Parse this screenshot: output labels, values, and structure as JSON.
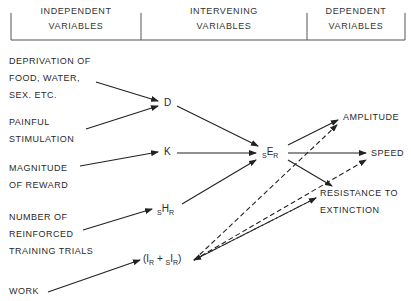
{
  "header": {
    "columns": [
      {
        "line1": "INDEPENDENT",
        "line2": "VARIABLES"
      },
      {
        "line1": "INTERVENING",
        "line2": "VARIABLES"
      },
      {
        "line1": "DEPENDENT",
        "line2": "VARIABLES"
      }
    ]
  },
  "independent": [
    {
      "lines": [
        "DEPRIVATION OF",
        "FOOD, WATER,",
        "SEX. ETC."
      ]
    },
    {
      "lines": [
        "PAINFUL",
        "STIMULATION"
      ]
    },
    {
      "lines": [
        "MAGNITUDE",
        "OF REWARD"
      ]
    },
    {
      "lines": [
        "NUMBER OF",
        "REINFORCED",
        "TRAINING TRIALS"
      ]
    },
    {
      "lines": [
        "WORK"
      ]
    }
  ],
  "intervening": {
    "D": "D",
    "K": "K",
    "sHR": {
      "pre": "S",
      "main": "H",
      "sub": "R"
    },
    "inhib": {
      "open": "(I",
      "sub1": "R",
      "plus": " + ",
      "pre": "S",
      "main": "I",
      "sub2": "R",
      "close": ")"
    },
    "sER": {
      "pre": "S",
      "main": "E",
      "sub": "R"
    }
  },
  "dependent": [
    {
      "lines": [
        "AMPLITUDE"
      ]
    },
    {
      "lines": [
        "SPEED"
      ]
    },
    {
      "lines": [
        "RESISTANCE TO",
        "EXTINCTION"
      ]
    }
  ]
}
